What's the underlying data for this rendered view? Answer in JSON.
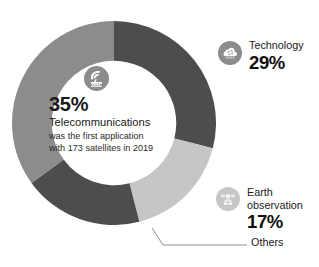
{
  "chart_data": {
    "type": "pie",
    "title": "",
    "subtitle": "",
    "xlabel": "",
    "ylabel": "",
    "legend_position": "callouts",
    "grid": false,
    "hole_ratio": 0.61,
    "start_angle_deg": 0,
    "direction": "clockwise",
    "categories": [
      "Technology",
      "Earth observation",
      "Others",
      "Telecommunications"
    ],
    "values": [
      29,
      17,
      19,
      35
    ],
    "unit": "%",
    "colors": [
      "#4d4d4d",
      "#c6c6c6",
      "#4d4d4d",
      "#8c8c8c"
    ],
    "series": [
      {
        "name": "Satellite applications share",
        "values": [
          29,
          17,
          19,
          35
        ]
      }
    ],
    "slices": [
      {
        "label": "Technology",
        "value": 29,
        "display": "29%",
        "color": "#4d4d4d"
      },
      {
        "label": "Earth observation",
        "value": 17,
        "display": "17%",
        "color": "#c6c6c6"
      },
      {
        "label": "Others",
        "value": 19,
        "display": "",
        "color": "#4d4d4d"
      },
      {
        "label": "Telecommunications",
        "value": 35,
        "display": "35%",
        "color": "#8c8c8c"
      }
    ],
    "annotations": [
      "35% Telecommunications was the first application with 173 satellites in 2019"
    ]
  },
  "colors": {
    "technology": "#4d4d4d",
    "telecommunications": "#8c8c8c",
    "earth_observation": "#c6c6c6",
    "others": "#4d4d4d",
    "icon_dark": "#8c8c8c",
    "icon_light": "#c6c6c6",
    "leader_line": "#8c8c8c",
    "text": "#1a1a1a",
    "background": "#ffffff"
  },
  "center": {
    "icon": "satellite-dish-icon",
    "percent": "35%",
    "title": "Telecommunications",
    "sub_line1": "was the first application",
    "sub_line2": "with 173 satellites in 2019"
  },
  "callouts": {
    "technology": {
      "icon": "technology-chip-cloud-icon",
      "label": "Technology",
      "percent": "29%"
    },
    "earth_observation": {
      "icon": "earth-observation-satellite-icon",
      "label_line1": "Earth",
      "label_line2": "observation",
      "percent": "17%"
    },
    "others": {
      "label": "Others"
    }
  }
}
